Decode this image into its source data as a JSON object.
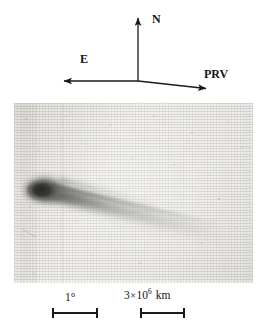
{
  "figure": {
    "type": "astronomical-photograph",
    "width": 267,
    "height": 335
  },
  "compass": {
    "origin": {
      "x": 138,
      "y": 81
    },
    "arrows": [
      {
        "id": "north",
        "label": "N",
        "from": {
          "x": 138,
          "y": 81
        },
        "to": {
          "x": 138,
          "y": 16
        },
        "label_pos": {
          "x": 152,
          "y": 13
        }
      },
      {
        "id": "east",
        "label": "E",
        "from": {
          "x": 138,
          "y": 81
        },
        "to": {
          "x": 62,
          "y": 81
        },
        "label_pos": {
          "x": 80,
          "y": 53
        }
      },
      {
        "id": "prv",
        "label": "PRV",
        "from": {
          "x": 138,
          "y": 81
        },
        "to": {
          "x": 209,
          "y": 89
        },
        "label_pos": {
          "x": 204,
          "y": 68
        }
      }
    ],
    "line_color": "#1a1a1a"
  },
  "plate": {
    "frame": {
      "x": 14,
      "y": 103,
      "width": 239,
      "height": 180
    },
    "background_color": "#eceae6",
    "comet": {
      "head": {
        "x": 31,
        "y": 87,
        "rx": 17,
        "ry": 11
      },
      "coma_color": "#1c1c1c",
      "tail_color": "#6e6c68",
      "tail_direction": "right and slightly down",
      "tail_end": {
        "x": 215,
        "y": 135
      }
    }
  },
  "scales": [
    {
      "id": "angular-scale",
      "label": "1°",
      "bar": {
        "x": 52,
        "y": 312,
        "length": 46
      },
      "label_pos": {
        "x": 65,
        "y": 292
      }
    },
    {
      "id": "linear-scale",
      "label_mantissa": "3",
      "label_times": "×",
      "label_base": "10",
      "label_exponent": "6",
      "label_unit": "km",
      "label_full": "3 × 10⁶ km",
      "bar": {
        "x": 140,
        "y": 312,
        "length": 45
      },
      "label_pos": {
        "x": 124,
        "y": 290
      }
    }
  ],
  "colors": {
    "ink": "#1a1a1a",
    "plate_base": "#eceae6",
    "paper": "#ffffff"
  }
}
